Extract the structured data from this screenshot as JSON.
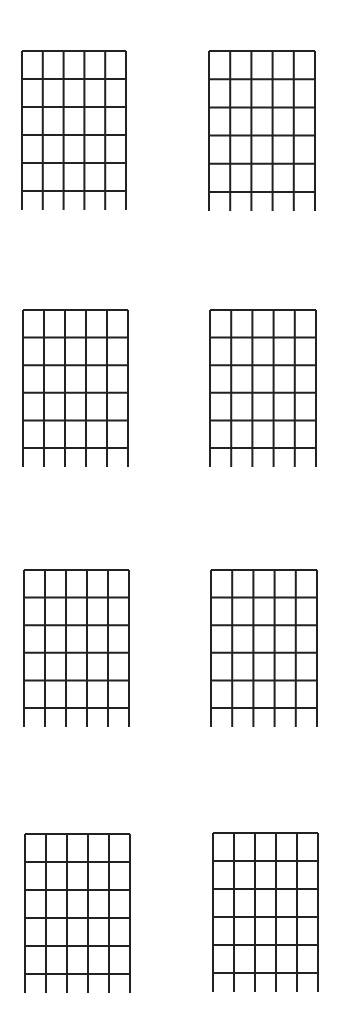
{
  "sheet": {
    "background": "#ffffff",
    "line_color": "#222222",
    "line_width": 2
  },
  "chord_diagram_spec": {
    "strings": 6,
    "fret_lines": 6,
    "string_extension_below": 19
  },
  "diagrams": [
    {
      "id": "chord-1",
      "x": 22,
      "y": 51,
      "width": 104,
      "height": 140
    },
    {
      "id": "chord-2",
      "x": 209,
      "y": 51,
      "width": 106,
      "height": 141
    },
    {
      "id": "chord-3",
      "x": 23,
      "y": 310,
      "width": 105,
      "height": 138
    },
    {
      "id": "chord-4",
      "x": 210,
      "y": 310,
      "width": 106,
      "height": 138
    },
    {
      "id": "chord-5",
      "x": 24,
      "y": 570,
      "width": 105,
      "height": 138
    },
    {
      "id": "chord-6",
      "x": 211,
      "y": 570,
      "width": 106,
      "height": 138
    },
    {
      "id": "chord-7",
      "x": 25,
      "y": 834,
      "width": 105,
      "height": 140
    },
    {
      "id": "chord-8",
      "x": 213,
      "y": 833,
      "width": 105,
      "height": 140
    }
  ]
}
